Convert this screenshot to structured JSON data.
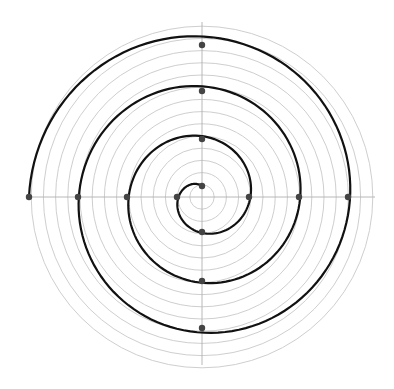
{
  "diagram": {
    "center": [
      202,
      197
    ],
    "grid": {
      "circle_count": 14,
      "circle_spacing": 12.2,
      "circle_color": "#c8c8c8",
      "axis_color": "#b0b0b0",
      "axis_extent": 173
    },
    "spiral": {
      "color": "#111111",
      "stroke_width": 2.2,
      "points": [
        [
          202,
          186
        ],
        [
          177,
          197
        ],
        [
          202,
          232
        ],
        [
          249,
          197
        ],
        [
          202,
          139
        ],
        [
          127,
          197
        ],
        [
          202,
          281
        ],
        [
          299,
          197
        ],
        [
          202,
          91
        ],
        [
          78,
          197
        ],
        [
          202,
          328
        ],
        [
          348,
          197
        ],
        [
          202,
          45
        ],
        [
          29,
          197
        ]
      ]
    },
    "markers": {
      "color": "#444444",
      "radius": 3.2
    }
  }
}
